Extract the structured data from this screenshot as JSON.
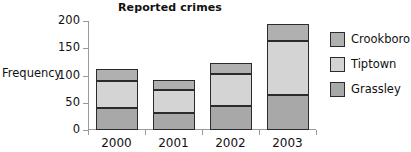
{
  "chart_data": {
    "type": "bar",
    "subtype": "stacked-bar",
    "title": "Reported crimes",
    "xlabel": "",
    "ylabel": "Frequency",
    "categories": [
      "2000",
      "2001",
      "2002",
      "2003"
    ],
    "ylim": [
      0,
      200
    ],
    "yticks": [
      0,
      50,
      100,
      150,
      200
    ],
    "ytick_labels": [
      "0",
      "50",
      "100",
      "150",
      "200"
    ],
    "grid": false,
    "legend_position": "right",
    "series": [
      {
        "name": "Grassley",
        "values": [
          40,
          32,
          44,
          64
        ],
        "color": "#a8a8a8",
        "stack_order": 0
      },
      {
        "name": "Tiptown",
        "values": [
          50,
          41,
          59,
          99
        ],
        "color": "#d4d4d4",
        "stack_order": 1
      },
      {
        "name": "Crookboro",
        "values": [
          22,
          19,
          20,
          32
        ],
        "color": "#b0b0b0",
        "stack_order": 2
      }
    ],
    "totals": [
      112,
      92,
      123,
      195
    ],
    "cumulative_boundaries": [
      {
        "category": "2000",
        "grassley_top": 40,
        "tiptown_top": 90,
        "crookboro_top": 112
      },
      {
        "category": "2001",
        "grassley_top": 32,
        "tiptown_top": 73,
        "crookboro_top": 92
      },
      {
        "category": "2002",
        "grassley_top": 44,
        "tiptown_top": 103,
        "crookboro_top": 123
      },
      {
        "category": "2003",
        "grassley_top": 64,
        "tiptown_top": 163,
        "crookboro_top": 195
      }
    ]
  },
  "legend": {
    "entries": [
      {
        "label": "Crookboro",
        "color": "#b0b0b0"
      },
      {
        "label": "Tiptown",
        "color": "#d4d4d4"
      },
      {
        "label": "Grassley",
        "color": "#a8a8a8"
      }
    ]
  },
  "axis": {
    "line_color": "#9a9a9a",
    "bar_outline_color": "#2b2b2b"
  }
}
